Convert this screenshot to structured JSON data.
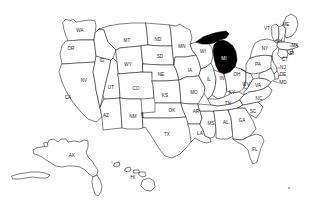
{
  "figure": {
    "kind": "choropleth-locator-map",
    "background_color": "#ffffff",
    "outline_color": "#1a1a1a",
    "default_state_fill": "#ffffff",
    "highlight_fill": "#000000",
    "highlight_label_color": "#ffffff",
    "highlighted_states": [
      "MI"
    ]
  },
  "states": [
    {
      "code": "WA",
      "label_x": 80,
      "label_y": 31,
      "highlighted": false
    },
    {
      "code": "OR",
      "label_x": 71,
      "label_y": 49,
      "highlighted": false
    },
    {
      "code": "CA",
      "label_x": 68,
      "label_y": 98,
      "highlighted": false
    },
    {
      "code": "NV",
      "label_x": 84,
      "label_y": 81,
      "highlighted": false
    },
    {
      "code": "ID",
      "label_x": 102,
      "label_y": 61,
      "highlighted": false
    },
    {
      "code": "MT",
      "label_x": 127,
      "label_y": 41,
      "highlighted": false
    },
    {
      "code": "WY",
      "label_x": 128,
      "label_y": 65,
      "highlighted": false
    },
    {
      "code": "UT",
      "label_x": 111,
      "label_y": 88,
      "highlighted": false
    },
    {
      "code": "AZ",
      "label_x": 106,
      "label_y": 116,
      "highlighted": false
    },
    {
      "code": "CO",
      "label_x": 136,
      "label_y": 89,
      "highlighted": false
    },
    {
      "code": "NM",
      "label_x": 133,
      "label_y": 117,
      "highlighted": false
    },
    {
      "code": "ND",
      "label_x": 158,
      "label_y": 40,
      "highlighted": false
    },
    {
      "code": "SD",
      "label_x": 160,
      "label_y": 57,
      "highlighted": false
    },
    {
      "code": "NE",
      "label_x": 161,
      "label_y": 75,
      "highlighted": false
    },
    {
      "code": "KS",
      "label_x": 165,
      "label_y": 96,
      "highlighted": false
    },
    {
      "code": "OK",
      "label_x": 172,
      "label_y": 111,
      "highlighted": false
    },
    {
      "code": "TX",
      "label_x": 167,
      "label_y": 135,
      "highlighted": false
    },
    {
      "code": "MN",
      "label_x": 182,
      "label_y": 47,
      "highlighted": false
    },
    {
      "code": "IA",
      "label_x": 190,
      "label_y": 71,
      "highlighted": false
    },
    {
      "code": "MO",
      "label_x": 194,
      "label_y": 93,
      "highlighted": false
    },
    {
      "code": "AR",
      "label_x": 196,
      "label_y": 112,
      "highlighted": false
    },
    {
      "code": "LA",
      "label_x": 200,
      "label_y": 134,
      "highlighted": false
    },
    {
      "code": "WI",
      "label_x": 203,
      "label_y": 52,
      "highlighted": false
    },
    {
      "code": "IL",
      "label_x": 209,
      "label_y": 80,
      "highlighted": false
    },
    {
      "code": "MS",
      "label_x": 211,
      "label_y": 124,
      "highlighted": false
    },
    {
      "code": "MI",
      "label_x": 224,
      "label_y": 59,
      "highlighted": true
    },
    {
      "code": "IN",
      "label_x": 222,
      "label_y": 79,
      "highlighted": false
    },
    {
      "code": "KY",
      "label_x": 232,
      "label_y": 93,
      "highlighted": false
    },
    {
      "code": "TN",
      "label_x": 228,
      "label_y": 104,
      "highlighted": false
    },
    {
      "code": "AL",
      "label_x": 226,
      "label_y": 123,
      "highlighted": false
    },
    {
      "code": "OH",
      "label_x": 237,
      "label_y": 75,
      "highlighted": false
    },
    {
      "code": "WV",
      "label_x": 246,
      "label_y": 85,
      "highlighted": false
    },
    {
      "code": "GA",
      "label_x": 242,
      "label_y": 121,
      "highlighted": false
    },
    {
      "code": "FL",
      "label_x": 255,
      "label_y": 150,
      "highlighted": false
    },
    {
      "code": "VA",
      "label_x": 258,
      "label_y": 86,
      "highlighted": false
    },
    {
      "code": "SC",
      "label_x": 253,
      "label_y": 112,
      "highlighted": false
    },
    {
      "code": "NC",
      "label_x": 259,
      "label_y": 99,
      "highlighted": false
    },
    {
      "code": "PA",
      "label_x": 258,
      "label_y": 65,
      "highlighted": false
    },
    {
      "code": "NY",
      "label_x": 265,
      "label_y": 49,
      "highlighted": false
    },
    {
      "code": "VT",
      "label_x": 267,
      "label_y": 29,
      "highlighted": false
    },
    {
      "code": "ME",
      "label_x": 286,
      "label_y": 25,
      "highlighted": false
    },
    {
      "code": "NH",
      "label_x": 279,
      "label_y": 42,
      "highlighted": false
    },
    {
      "code": "MA",
      "label_x": 295,
      "label_y": 46,
      "highlighted": false
    },
    {
      "code": "RI",
      "label_x": 292,
      "label_y": 54,
      "highlighted": false
    },
    {
      "code": "CT",
      "label_x": 285,
      "label_y": 60,
      "highlighted": false
    },
    {
      "code": "NJ",
      "label_x": 283,
      "label_y": 68,
      "highlighted": false
    },
    {
      "code": "DE",
      "label_x": 283,
      "label_y": 75,
      "highlighted": false
    },
    {
      "code": "MD",
      "label_x": 283,
      "label_y": 83,
      "highlighted": false
    },
    {
      "code": "AK",
      "label_x": 72,
      "label_y": 156,
      "highlighted": false
    },
    {
      "code": "HI",
      "label_x": 133,
      "label_y": 178,
      "highlighted": false
    }
  ]
}
